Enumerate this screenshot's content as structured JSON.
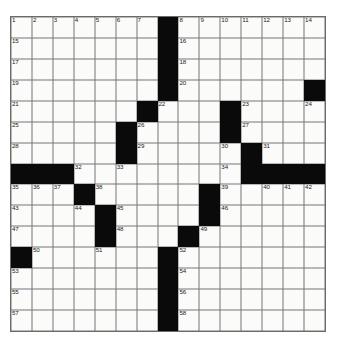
{
  "puzzle": {
    "title": "Crossword Grid",
    "size": {
      "rows": 15,
      "cols": 15
    },
    "colors": {
      "block": "#0a0a0a",
      "cell": "#fbfbfa",
      "grid_line": "#777777",
      "number_text": "#1a1a1a",
      "background": "#ffffff"
    },
    "blocks": [
      [
        0,
        7
      ],
      [
        1,
        7
      ],
      [
        2,
        7
      ],
      [
        3,
        7
      ],
      [
        3,
        14
      ],
      [
        4,
        6
      ],
      [
        4,
        10
      ],
      [
        5,
        5
      ],
      [
        5,
        10
      ],
      [
        6,
        5
      ],
      [
        6,
        11
      ],
      [
        7,
        0
      ],
      [
        7,
        1
      ],
      [
        7,
        2
      ],
      [
        7,
        11
      ],
      [
        7,
        12
      ],
      [
        7,
        13
      ],
      [
        7,
        14
      ],
      [
        8,
        3
      ],
      [
        8,
        9
      ],
      [
        9,
        4
      ],
      [
        9,
        9
      ],
      [
        10,
        4
      ],
      [
        10,
        8
      ],
      [
        11,
        0
      ],
      [
        11,
        7
      ],
      [
        12,
        7
      ],
      [
        13,
        7
      ],
      [
        14,
        7
      ]
    ],
    "numbers": [
      {
        "row": 0,
        "col": 0,
        "n": "1"
      },
      {
        "row": 0,
        "col": 1,
        "n": "2"
      },
      {
        "row": 0,
        "col": 2,
        "n": "3"
      },
      {
        "row": 0,
        "col": 3,
        "n": "4"
      },
      {
        "row": 0,
        "col": 4,
        "n": "5"
      },
      {
        "row": 0,
        "col": 5,
        "n": "6"
      },
      {
        "row": 0,
        "col": 6,
        "n": "7"
      },
      {
        "row": 0,
        "col": 8,
        "n": "8"
      },
      {
        "row": 0,
        "col": 9,
        "n": "9"
      },
      {
        "row": 0,
        "col": 10,
        "n": "10"
      },
      {
        "row": 0,
        "col": 11,
        "n": "11"
      },
      {
        "row": 0,
        "col": 12,
        "n": "12"
      },
      {
        "row": 0,
        "col": 13,
        "n": "13"
      },
      {
        "row": 0,
        "col": 14,
        "n": "14"
      },
      {
        "row": 1,
        "col": 0,
        "n": "15"
      },
      {
        "row": 1,
        "col": 8,
        "n": "16"
      },
      {
        "row": 2,
        "col": 0,
        "n": "17"
      },
      {
        "row": 2,
        "col": 8,
        "n": "18"
      },
      {
        "row": 3,
        "col": 0,
        "n": "19"
      },
      {
        "row": 3,
        "col": 8,
        "n": "20"
      },
      {
        "row": 4,
        "col": 0,
        "n": "21"
      },
      {
        "row": 4,
        "col": 7,
        "n": "22"
      },
      {
        "row": 4,
        "col": 11,
        "n": "23"
      },
      {
        "row": 4,
        "col": 14,
        "n": "24"
      },
      {
        "row": 5,
        "col": 0,
        "n": "25"
      },
      {
        "row": 5,
        "col": 6,
        "n": "26"
      },
      {
        "row": 5,
        "col": 11,
        "n": "27"
      },
      {
        "row": 6,
        "col": 0,
        "n": "28"
      },
      {
        "row": 6,
        "col": 6,
        "n": "29"
      },
      {
        "row": 6,
        "col": 10,
        "n": "30"
      },
      {
        "row": 6,
        "col": 12,
        "n": "31"
      },
      {
        "row": 7,
        "col": 3,
        "n": "32"
      },
      {
        "row": 7,
        "col": 5,
        "n": "33"
      },
      {
        "row": 7,
        "col": 10,
        "n": "34"
      },
      {
        "row": 8,
        "col": 0,
        "n": "35"
      },
      {
        "row": 8,
        "col": 1,
        "n": "36"
      },
      {
        "row": 8,
        "col": 2,
        "n": "37"
      },
      {
        "row": 8,
        "col": 4,
        "n": "38"
      },
      {
        "row": 8,
        "col": 10,
        "n": "39"
      },
      {
        "row": 8,
        "col": 12,
        "n": "40"
      },
      {
        "row": 8,
        "col": 13,
        "n": "41"
      },
      {
        "row": 8,
        "col": 14,
        "n": "42"
      },
      {
        "row": 9,
        "col": 0,
        "n": "43"
      },
      {
        "row": 9,
        "col": 3,
        "n": "44"
      },
      {
        "row": 9,
        "col": 5,
        "n": "45"
      },
      {
        "row": 9,
        "col": 10,
        "n": "46"
      },
      {
        "row": 10,
        "col": 0,
        "n": "47"
      },
      {
        "row": 10,
        "col": 5,
        "n": "48"
      },
      {
        "row": 10,
        "col": 9,
        "n": "49"
      },
      {
        "row": 11,
        "col": 1,
        "n": "50"
      },
      {
        "row": 11,
        "col": 4,
        "n": "51"
      },
      {
        "row": 11,
        "col": 8,
        "n": "52"
      },
      {
        "row": 12,
        "col": 0,
        "n": "53"
      },
      {
        "row": 12,
        "col": 8,
        "n": "54"
      },
      {
        "row": 13,
        "col": 0,
        "n": "55"
      },
      {
        "row": 13,
        "col": 8,
        "n": "56"
      },
      {
        "row": 14,
        "col": 0,
        "n": "57"
      },
      {
        "row": 14,
        "col": 8,
        "n": "58"
      }
    ],
    "letters": []
  }
}
